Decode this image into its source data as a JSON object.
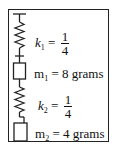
{
  "diagram": {
    "title": "",
    "components": [
      {
        "type": "ceiling",
        "label": ""
      },
      {
        "type": "spring",
        "symbol": "k",
        "subscript": "1",
        "eq": "=",
        "num": "1",
        "den": "4"
      },
      {
        "type": "mass",
        "symbol": "m",
        "subscript": "1",
        "text": " = 8 grams"
      },
      {
        "type": "spring",
        "symbol": "k",
        "subscript": "2",
        "eq": "=",
        "num": "1",
        "den": "4"
      },
      {
        "type": "mass",
        "symbol": "m",
        "subscript": "2",
        "text": " = 4 grams"
      }
    ],
    "connections": [
      [
        "ceiling",
        "spring-1"
      ],
      [
        "spring-1",
        "mass-1"
      ],
      [
        "mass-1",
        "spring-2"
      ],
      [
        "spring-2",
        "mass-2"
      ]
    ],
    "colors": {
      "line": "#222222",
      "background": "#ffffff"
    }
  }
}
